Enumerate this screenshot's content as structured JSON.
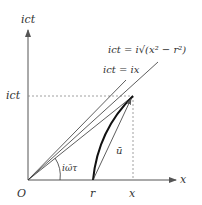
{
  "labels": {
    "y_axis": "ict",
    "x_axis": "x",
    "origin": "O",
    "r_tick": "r",
    "x_tick": "x",
    "ict_tick": "ict",
    "line_hyperbola": "ict = i√(x² − r²)",
    "line_light": "ict = ix",
    "angle": "iω̄τ",
    "vector": "ū"
  }
}
